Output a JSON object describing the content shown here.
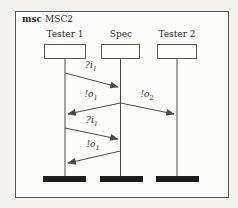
{
  "diagram": {
    "type": "message-sequence-chart",
    "kind_label": "msc",
    "title": "MSC2",
    "instances": [
      {
        "name": "Tester 1"
      },
      {
        "name": "Spec"
      },
      {
        "name": "Tester 2"
      }
    ],
    "messages": [
      {
        "label_main": "?i",
        "label_sub": "1",
        "from": "Tester 1",
        "to": "Spec"
      },
      {
        "label_main": "!o",
        "label_sub": "1",
        "from": "Spec",
        "to": "Tester 1"
      },
      {
        "label_main": "!o",
        "label_sub": "2",
        "from": "Spec",
        "to": "Tester 2"
      },
      {
        "label_main": "?i",
        "label_sub": "1",
        "from": "Tester 1",
        "to": "Spec"
      },
      {
        "label_main": "!o",
        "label_sub": "1",
        "from": "Spec",
        "to": "Tester 1"
      }
    ],
    "colors": {
      "line": "#4a4a4a",
      "end_bar": "#1e1e1e",
      "frame_background": "#fcfcfa",
      "page_background": "#f4f3f0"
    }
  }
}
